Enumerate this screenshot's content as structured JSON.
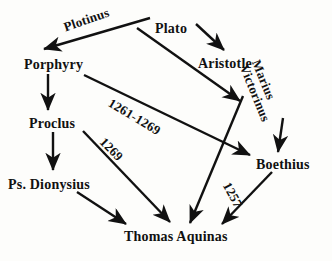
{
  "diagram": {
    "type": "directed-graph",
    "title": "",
    "background_color": "#fdfdfb",
    "ink_color": "#111111",
    "nodes": [
      {
        "id": "plato",
        "label": "Plato",
        "x": 155,
        "y": 22,
        "rotation": 0
      },
      {
        "id": "porphyry",
        "label": "Porphyry",
        "x": 24,
        "y": 58,
        "rotation": 0
      },
      {
        "id": "aristotle",
        "label": "Aristotle",
        "x": 198,
        "y": 57,
        "rotation": 0
      },
      {
        "id": "proclus",
        "label": "Proclus",
        "x": 29,
        "y": 117,
        "rotation": 0
      },
      {
        "id": "marius",
        "label": "Marius\nVictorinus",
        "x": 252,
        "y": 60,
        "rotation": 68
      },
      {
        "id": "boethius",
        "label": "Boethius",
        "x": 256,
        "y": 158,
        "rotation": 0
      },
      {
        "id": "dionysius",
        "label": "Ps. Dionysius",
        "x": 8,
        "y": 178,
        "rotation": 0
      },
      {
        "id": "aquinas",
        "label": "Thomas Aquinas",
        "x": 124,
        "y": 230,
        "rotation": 0
      }
    ],
    "edges": [
      {
        "id": "plato-porphyry",
        "from": "plato",
        "to": "porphyry",
        "label": "Plotinus",
        "label_rotation": -19
      },
      {
        "id": "plato-aristotle",
        "from": "plato",
        "to": "aristotle",
        "label": ""
      },
      {
        "id": "plato-marius",
        "from": "plato",
        "to": "marius",
        "label": ""
      },
      {
        "id": "porphyry-proclus",
        "from": "porphyry",
        "to": "proclus",
        "label": ""
      },
      {
        "id": "porphyry-boethius",
        "from": "porphyry",
        "to": "boethius",
        "label": "1261-1269",
        "label_rotation": 31
      },
      {
        "id": "proclus-dionysius",
        "from": "proclus",
        "to": "dionysius",
        "label": ""
      },
      {
        "id": "proclus-aquinas",
        "from": "proclus",
        "to": "aquinas",
        "label": "1269",
        "label_rotation": 46
      },
      {
        "id": "marius-boethius",
        "from": "marius",
        "to": "boethius",
        "label": ""
      },
      {
        "id": "marius-aquinas",
        "from": "marius",
        "to": "aquinas",
        "label": ""
      },
      {
        "id": "boethius-aquinas",
        "from": "boethius",
        "to": "aquinas",
        "label": "1257",
        "label_rotation": 61
      },
      {
        "id": "dionysius-aquinas",
        "from": "dionysius",
        "to": "aquinas",
        "label": ""
      }
    ],
    "edge_labels": [
      {
        "id": "label-plotinus",
        "text": "Plotinus",
        "x": 62,
        "y": 21,
        "rotation": -19
      },
      {
        "id": "label-1261-1269",
        "text": "1261-1269",
        "x": 113,
        "y": 96,
        "rotation": 31
      },
      {
        "id": "label-1269",
        "text": "1269",
        "x": 107,
        "y": 135,
        "rotation": 46
      },
      {
        "id": "label-1257",
        "text": "1257",
        "x": 232,
        "y": 180,
        "rotation": 61
      }
    ]
  }
}
